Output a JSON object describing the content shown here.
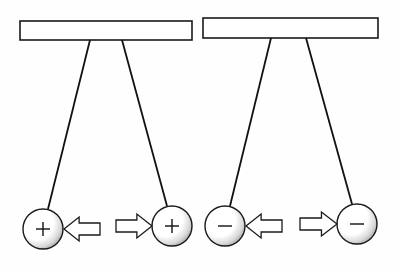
{
  "diagram": {
    "colors": {
      "line": "#111111",
      "background": "#ffffff",
      "shading": "#8a8a8a"
    },
    "panels": [
      {
        "name": "positive-pair",
        "bar": {
          "x": 20,
          "y": 21,
          "width": 172,
          "height": 19
        },
        "balls": [
          {
            "cx": 43,
            "cy": 229,
            "r": 20,
            "charge": "+",
            "string_top": [
              90,
              40
            ],
            "string_bottom": [
              48,
              209
            ],
            "arrow": {
              "direction": "left",
              "x_from": 100,
              "x_to": 64,
              "y": 229
            }
          },
          {
            "cx": 172,
            "cy": 226,
            "r": 20,
            "charge": "+",
            "string_top": [
              122,
              40
            ],
            "string_bottom": [
              167,
              206
            ],
            "arrow": {
              "direction": "right",
              "x_from": 116,
              "x_to": 152,
              "y": 226
            }
          }
        ]
      },
      {
        "name": "negative-pair",
        "bar": {
          "x": 203,
          "y": 18,
          "width": 175,
          "height": 20
        },
        "balls": [
          {
            "cx": 225,
            "cy": 226,
            "r": 20,
            "charge": "−",
            "string_top": [
              271,
              38
            ],
            "string_bottom": [
              230,
              206
            ],
            "arrow": {
              "direction": "left",
              "x_from": 282,
              "x_to": 246,
              "y": 226
            }
          },
          {
            "cx": 357,
            "cy": 224,
            "r": 20,
            "charge": "−",
            "string_top": [
              306,
              38
            ],
            "string_bottom": [
              352,
              204
            ],
            "arrow": {
              "direction": "right",
              "x_from": 300,
              "x_to": 337,
              "y": 224
            }
          }
        ]
      }
    ],
    "labels": {
      "positive_sign": "+",
      "negative_sign": "−"
    }
  }
}
